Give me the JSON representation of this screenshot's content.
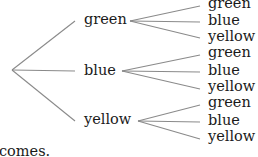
{
  "tree": {
    "root": {
      "x": 12,
      "y": 70
    },
    "level1": [
      {
        "label": "green",
        "x": 84,
        "y": 20,
        "line_end": [
          75,
          21
        ],
        "branch_from": [
          130,
          21
        ],
        "leaves": [
          {
            "label": "green",
            "y": 5
          },
          {
            "label": "blue",
            "y": 21
          },
          {
            "label": "yellow",
            "y": 37
          }
        ]
      },
      {
        "label": "blue",
        "x": 84,
        "y": 70,
        "line_end": [
          75,
          71
        ],
        "branch_from": [
          122,
          71
        ],
        "leaves": [
          {
            "label": "green",
            "y": 54
          },
          {
            "label": "blue",
            "y": 71
          },
          {
            "label": "yellow",
            "y": 88
          }
        ]
      },
      {
        "label": "yellow",
        "x": 84,
        "y": 120,
        "line_end": [
          75,
          121
        ],
        "branch_from": [
          138,
          121
        ],
        "leaves": [
          {
            "label": "green",
            "y": 104
          },
          {
            "label": "blue",
            "y": 121
          },
          {
            "label": "yellow",
            "y": 138
          }
        ]
      }
    ],
    "leaf_x": 208,
    "leaf_line_end_x": 200,
    "line_color": "#8a8a8a"
  },
  "caption": {
    "text": "comes."
  }
}
